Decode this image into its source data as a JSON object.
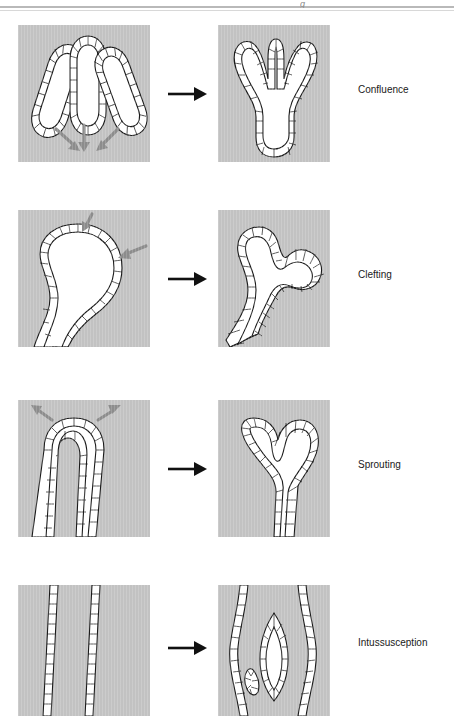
{
  "figure": {
    "header_fragment": "g",
    "transition_arrow_glyph": "→",
    "colors": {
      "stroma_background": "#c2c2c2",
      "lumen_fill": "#ffffff",
      "epithelium_outline": "#1a1a1a",
      "guide_arrow": "#8c8c8c",
      "label_text": "#1a1a1a",
      "page": "#ffffff"
    },
    "rows": [
      {
        "id": "confluence",
        "label": "Confluence",
        "before": {
          "name": "three-separate-epithelial-tubes",
          "description": "Three separate elongated epithelial tubules with cuboidal cell lining, splayed apart",
          "tube_count": 3,
          "guide_arrows": 3,
          "guide_arrow_direction": "converging-downward"
        },
        "after": {
          "name": "fused-trifurcated-epithelial-tree",
          "description": "Single fused trifurcated branched epithelial structure with common stalk",
          "branch_count": 3,
          "guide_arrows": 0
        }
      },
      {
        "id": "clefting",
        "label": "Clefting",
        "before": {
          "name": "single-bulbous-end-bud",
          "description": "Single large bulbous terminal end bud with smooth epithelial border",
          "tube_count": 1,
          "guide_arrows": 2,
          "guide_arrow_direction": "inward-indenting"
        },
        "after": {
          "name": "cleft-lobed-end-bud",
          "description": "End bud subdivided by clefts into three lobes sharing one lumen",
          "branch_count": 3,
          "guide_arrows": 0
        }
      },
      {
        "id": "sprouting",
        "label": "Sprouting",
        "before": {
          "name": "narrow-epithelial-duct-tip",
          "description": "Narrow epithelial duct with rounded blunt tip",
          "tube_count": 1,
          "guide_arrows": 2,
          "guide_arrow_direction": "outward-diverging"
        },
        "after": {
          "name": "bifurcated-sprouted-tip",
          "description": "Duct tip expanded and split into two outgrowing sprouts forming a heart-shaped lumen",
          "branch_count": 2,
          "guide_arrows": 0
        }
      },
      {
        "id": "intussusception",
        "label": "Intussusception",
        "before": {
          "name": "wide-single-lumen-duct",
          "description": "Wide duct bounded by two near-parallel epithelial walls enclosing one broad lumen",
          "tube_count": 1,
          "guide_arrows": 0
        },
        "after": {
          "name": "pillar-split-lumen",
          "description": "Transluminal epithelial pillar inserted into the lumen, subdividing it into two channels",
          "branch_count": 2,
          "pillar_count": 2,
          "guide_arrows": 0
        }
      }
    ]
  }
}
